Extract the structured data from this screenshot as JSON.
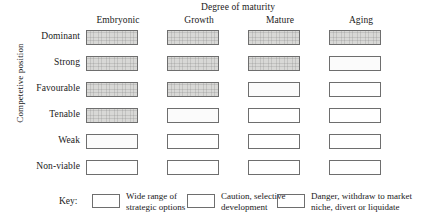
{
  "chart_data": {
    "type": "heatmap",
    "title": "Degree of maturity",
    "xlabel": "Degree of maturity",
    "ylabel": "Competetive position",
    "categories": [
      "Embryonic",
      "Growth",
      "Mature",
      "Aging"
    ],
    "rows": [
      "Dominant",
      "Strong",
      "Favourable",
      "Tenable",
      "Weak",
      "Non-viable"
    ],
    "legend_position": "bottom",
    "grid": false,
    "cell_states": [
      "wide",
      "caution",
      "danger"
    ],
    "matrix": [
      {
        "row": "Dominant",
        "values": [
          "wide",
          "wide",
          "wide",
          "wide"
        ]
      },
      {
        "row": "Strong",
        "values": [
          "wide",
          "wide",
          "wide",
          "caution"
        ]
      },
      {
        "row": "Favourable",
        "values": [
          "wide",
          "wide",
          "caution",
          "danger"
        ]
      },
      {
        "row": "Tenable",
        "values": [
          "wide",
          "caution",
          "danger",
          "danger"
        ]
      },
      {
        "row": "Weak",
        "values": [
          "caution",
          "danger",
          "danger",
          "danger"
        ]
      },
      {
        "row": "Non-viable",
        "values": [
          "danger",
          "danger",
          "danger",
          "danger"
        ]
      }
    ],
    "legend": [
      {
        "state": "wide",
        "label_line1": "Wide range of",
        "label_line2": "strategic options"
      },
      {
        "state": "caution",
        "label_line1": "Caution, selective",
        "label_line2": "development"
      },
      {
        "state": "danger",
        "label_line1": "Danger, withdraw to market",
        "label_line2": "niche, divert or liquidate"
      }
    ],
    "colors": {
      "wide_fill": "#d8d8d6",
      "caution_fill": "#fbfbfb",
      "danger_fill": "#ffffff",
      "border": "#6e6e6e",
      "text": "#1a1a1a",
      "background": "#ffffff"
    }
  },
  "legend_key_label": "Key:"
}
